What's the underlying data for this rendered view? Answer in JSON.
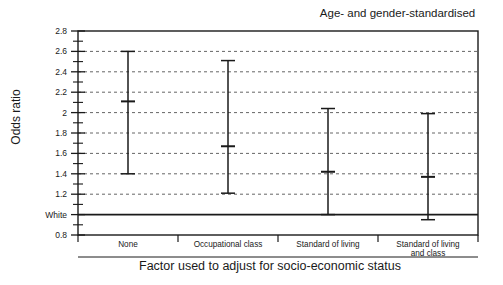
{
  "chart_data": {
    "type": "scatter",
    "title": "Age- and gender-standardised",
    "xlabel": "Factor used to adjust for socio-economic status",
    "ylabel": "Odds ratio",
    "categories": [
      "None",
      "Occupational class",
      "Standard of living",
      "Standard of living and class"
    ],
    "category_labels_wrapped": [
      [
        "None"
      ],
      [
        "Occupational class"
      ],
      [
        "Standard of living"
      ],
      [
        "Standard of living",
        "and class"
      ]
    ],
    "values": [
      2.11,
      1.67,
      1.42,
      1.37
    ],
    "ci_low": [
      1.4,
      1.21,
      1.0,
      0.95
    ],
    "ci_high": [
      2.6,
      2.51,
      2.04,
      1.99
    ],
    "ylim": [
      0.8,
      2.8
    ],
    "ytick_labels": [
      "0.8",
      "White",
      "1.2",
      "1.4",
      "1.6",
      "1.8",
      "2",
      "2.2",
      "2.4",
      "2.6",
      "2.8"
    ],
    "ytick_values": [
      0.8,
      1.0,
      1.2,
      1.4,
      1.6,
      1.8,
      2.0,
      2.2,
      2.4,
      2.6,
      2.8
    ],
    "yminor_tick_values": [
      0.9,
      1.1,
      1.3,
      1.5,
      1.7,
      1.9,
      2.1,
      2.3,
      2.5,
      2.7
    ],
    "reference_line": {
      "value": 1.0,
      "label": "White"
    },
    "grid": "horizontal-dashed",
    "legend": "none",
    "series_name": "Odds ratio with 95% confidence interval",
    "colors": {
      "axis": "#1a1a1a",
      "grid": "#555555",
      "marker": "#1a1a1a",
      "background": "#ffffff"
    }
  }
}
